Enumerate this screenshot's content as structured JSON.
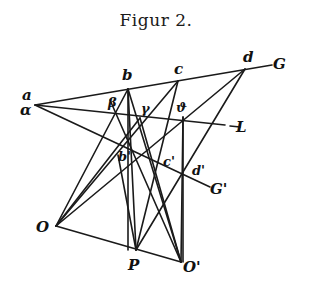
{
  "title": "Figur 2.",
  "labels": {
    "a": "a",
    "alpha": "α",
    "b": "b",
    "c": "c",
    "d": "d",
    "G": "G",
    "beta": "β",
    "gamma": "γ",
    "theta": "ϑ",
    "L": "L",
    "b_prime": "b'",
    "c_prime": "c'",
    "d_prime": "d'",
    "G_prime": "G'",
    "O": "O",
    "P": "P",
    "O_prime": "O'"
  },
  "colors": {
    "ink": "#1a1a1a",
    "background": "#ffffff"
  }
}
